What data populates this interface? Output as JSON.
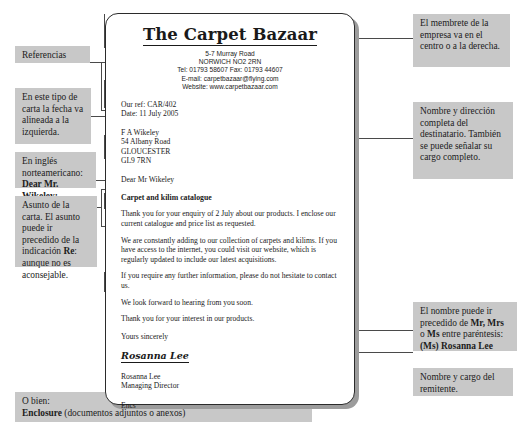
{
  "letter": {
    "company_name": "The Carpet Bazaar",
    "address_lines": [
      "5-7 Murray Road",
      "NORWICH NO2 2RN",
      "Tel: 01793 58607  Fax: 01793 44607",
      "E-mail: carpetbazaar@flying.com",
      "Website: www.carpetbazaar.com"
    ],
    "our_ref": "Our ref: CAR/402",
    "date": "Date: 11 July 2005",
    "recipient_lines": [
      "F A Wikeley",
      "54 Albany Road",
      "GLOUCESTER",
      "GL9 7RN"
    ],
    "salutation": "Dear Mr Wikeley",
    "subject": "Carpet and kilim catalogue",
    "paragraphs": [
      "Thank you for your enquiry of 2 July about our products. I enclose our current catalogue and price list as requested.",
      "We are constantly adding to our collection of carpets and kilims. If you have access to the internet, you could visit our website, which is regularly updated to include our latest acquisitions.",
      "If you require any further information, please do not hesitate to contact us.",
      "We look forward to hearing from you soon.",
      "Thank you for your interest in our products."
    ],
    "closing": "Yours sincerely",
    "signature": "Rosanna Lee",
    "signer_name": "Rosanna Lee",
    "signer_title": "Managing Director",
    "enclosure": "Encs"
  },
  "annotations": {
    "references": "Referencias",
    "date_left": "En este tipo de carta la fecha va alineada a la izquierda.",
    "american_english_plain": "En inglés norteamericano:",
    "american_english_bold": "Dear Mr. Wikeley:",
    "subject_note_a": "Asunto de la carta. El asunto puede ir precedido de la indicación ",
    "subject_note_bold": "Re",
    "subject_note_b": ": aunque no es aconsejable.",
    "enclosure_note_a": "O bien:",
    "enclosure_note_bold": "Enclosure",
    "enclosure_note_b": " (documentos adjuntos o anexos)",
    "letterhead_note": "El membrete de la empresa va en el centro o a la derecha.",
    "recipient_note": "Nombre y dirección completa del destinatario. También se puede señalar su cargo completo.",
    "name_note_a": "El nombre puede ir precedido de ",
    "name_note_bold1": "Mr, Mrs",
    "name_note_b": " o ",
    "name_note_bold2": "Ms",
    "name_note_c": " entre paréntesis:",
    "name_note_bold3": "(Ms) Rosanna Lee",
    "sender_note": "Nombre y cargo del remitente."
  },
  "colors": {
    "note_bg": "#c8c8c8",
    "line": "#4a4a4a",
    "border": "#2b2b2b",
    "shadow": "#9c9c9c"
  }
}
